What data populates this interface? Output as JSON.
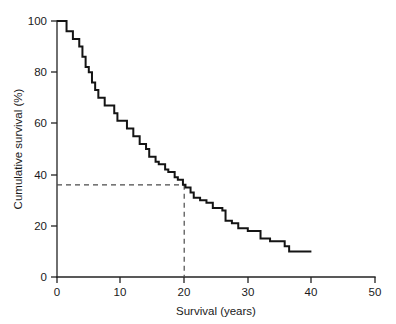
{
  "chart_data": {
    "type": "line",
    "subtype": "kaplan-meier-step",
    "title": "",
    "xlabel": "Survival (years)",
    "ylabel": "Cumulative survival (%)",
    "xlim": [
      0,
      50
    ],
    "ylim": [
      0,
      100
    ],
    "xticks": [
      0,
      10,
      20,
      30,
      40,
      50
    ],
    "xtick_labels": [
      "0",
      "10",
      "20",
      "30",
      "40",
      "50"
    ],
    "yticks": [
      0,
      20,
      40,
      60,
      80,
      100
    ],
    "ytick_labels": [
      "0",
      "20",
      "40",
      "60",
      "80",
      "100"
    ],
    "grid": false,
    "legend": null,
    "series": [
      {
        "name": "Cumulative survival",
        "style": "step-post",
        "x": [
          0,
          1,
          1.5,
          2.5,
          3.5,
          4,
          4.5,
          5,
          5.5,
          6,
          6.5,
          7.5,
          8,
          9,
          9.5,
          10.5,
          11,
          12,
          12.5,
          13,
          14,
          14.5,
          15.5,
          16,
          17,
          17.5,
          18.5,
          19,
          19.8,
          20.2,
          21,
          21.5,
          22.5,
          23.5,
          24.5,
          25.5,
          26,
          26.5,
          27.5,
          28.5,
          30,
          31.5,
          32,
          33.5,
          35,
          35.8,
          36.5,
          40
        ],
        "y": [
          100,
          100,
          96,
          93,
          90,
          86,
          82,
          80,
          76,
          73,
          70,
          67,
          67,
          64,
          61,
          61,
          58,
          55,
          55,
          52,
          50,
          47,
          45,
          44,
          42,
          41,
          39,
          38,
          36,
          35,
          33,
          31,
          30,
          29,
          27,
          27,
          26,
          22,
          21,
          19,
          18,
          18,
          15,
          14,
          14,
          12,
          10,
          10
        ],
        "color": "#141414"
      }
    ],
    "annotations": [
      {
        "name": "median-survival-reference",
        "type": "dashed-crosshair",
        "x": 20,
        "y": 36,
        "horizontal_from_x": 0,
        "vertical_to_y": 0,
        "style": "dashed",
        "color": "#4a4a4a"
      }
    ]
  },
  "axes": {
    "x_axis_name": "Survival (years)",
    "y_axis_name": "Cumulative survival (%)"
  }
}
